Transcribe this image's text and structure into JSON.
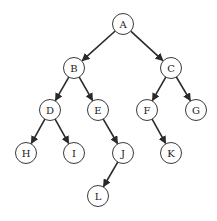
{
  "diagram": {
    "type": "binary-tree",
    "node_radius": 10.5,
    "colors": {
      "stroke": "#3a3a3a",
      "edge": "#2a2a2a",
      "fill": "#ffffff",
      "text": "#222222"
    },
    "nodes": [
      {
        "id": "A",
        "label": "A",
        "x": 123,
        "y": 24
      },
      {
        "id": "B",
        "label": "B",
        "x": 74,
        "y": 68
      },
      {
        "id": "C",
        "label": "C",
        "x": 171,
        "y": 68
      },
      {
        "id": "D",
        "label": "D",
        "x": 50,
        "y": 110
      },
      {
        "id": "E",
        "label": "E",
        "x": 98,
        "y": 110
      },
      {
        "id": "F",
        "label": "F",
        "x": 147,
        "y": 110
      },
      {
        "id": "G",
        "label": "G",
        "x": 196,
        "y": 110
      },
      {
        "id": "H",
        "label": "H",
        "x": 26,
        "y": 153
      },
      {
        "id": "I",
        "label": "I",
        "x": 74,
        "y": 153
      },
      {
        "id": "J",
        "label": "J",
        "x": 123,
        "y": 153
      },
      {
        "id": "K",
        "label": "K",
        "x": 171,
        "y": 153
      },
      {
        "id": "L",
        "label": "L",
        "x": 98,
        "y": 196
      }
    ],
    "edges": [
      {
        "from": "A",
        "to": "B"
      },
      {
        "from": "A",
        "to": "C"
      },
      {
        "from": "B",
        "to": "D"
      },
      {
        "from": "B",
        "to": "E"
      },
      {
        "from": "C",
        "to": "F"
      },
      {
        "from": "C",
        "to": "G"
      },
      {
        "from": "D",
        "to": "H"
      },
      {
        "from": "D",
        "to": "I"
      },
      {
        "from": "E",
        "to": "J"
      },
      {
        "from": "F",
        "to": "K"
      },
      {
        "from": "J",
        "to": "L"
      }
    ]
  }
}
